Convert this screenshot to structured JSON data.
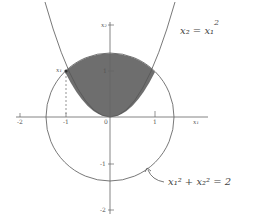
{
  "diagram": {
    "type": "region-plot",
    "shaded_region": "Region between parabola x2 = x1^2 and circle x1^2 + x2^2 = 2 (above parabola, inside circle)",
    "colors": {
      "shade": "#6e6e6e",
      "curve": "#555555",
      "axis": "#666666",
      "background": "#ffffff"
    },
    "axes": {
      "x_label": "x₁",
      "y_label": "x₂",
      "x_ticks": [
        "-2",
        "-1",
        "0",
        "1"
      ],
      "y_ticks": [
        "1",
        "-1",
        "-2"
      ]
    },
    "curves": [
      {
        "name": "parabola",
        "equation": "x₂ = x₁²"
      },
      {
        "name": "circle",
        "equation": "x₁² + x₂² = 2"
      }
    ],
    "annotations": {
      "point_label": "x₁",
      "parabola_label_main": "x₂ = x₁",
      "parabola_label_sup": "2",
      "circle_label_main": "x₁² + x₂² = 2"
    }
  }
}
